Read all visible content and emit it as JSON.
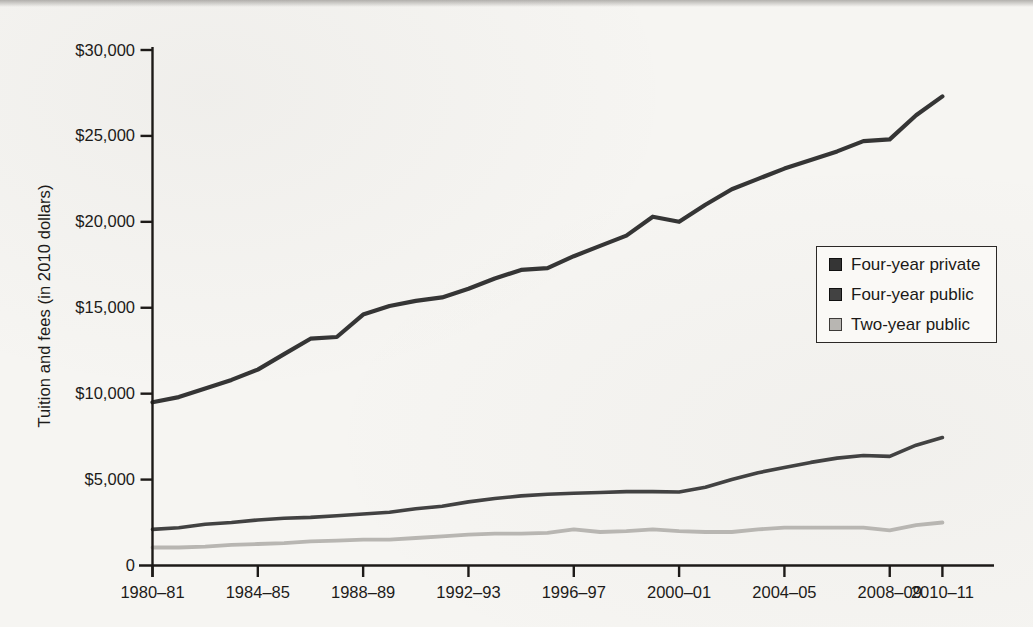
{
  "page": {
    "background_color": "#f6f5f2",
    "note": ""
  },
  "chart_data": {
    "type": "line",
    "title": "",
    "xlabel": "",
    "ylabel": "Tuition and fees (in 2010 dollars)",
    "ylim": [
      0,
      30000
    ],
    "grid": false,
    "legend_position": "middle-right",
    "axis_color": "#1d1a18",
    "tick_label_color": "#1d1b19",
    "y_ticks": [
      {
        "value": 30000,
        "label": "$30,000"
      },
      {
        "value": 25000,
        "label": "$25,000"
      },
      {
        "value": 20000,
        "label": "$20,000"
      },
      {
        "value": 15000,
        "label": "$15,000"
      },
      {
        "value": 10000,
        "label": "$10,000"
      },
      {
        "value": 5000,
        "label": "$5,000"
      },
      {
        "value": 0,
        "label": "0"
      }
    ],
    "categories": [
      "1980–81",
      "1981–82",
      "1982–83",
      "1983–84",
      "1984–85",
      "1985–86",
      "1986–87",
      "1987–88",
      "1988–89",
      "1989–90",
      "1990–91",
      "1991–92",
      "1992–93",
      "1993–94",
      "1994–95",
      "1995–96",
      "1996–97",
      "1997–98",
      "1998–99",
      "1999–00",
      "2000–01",
      "2001–02",
      "2002–03",
      "2003–04",
      "2004–05",
      "2005–06",
      "2006–07",
      "2007–08",
      "2008–09",
      "2009–10",
      "2010–11"
    ],
    "x_tick_indices": [
      0,
      4,
      8,
      12,
      16,
      20,
      24,
      28,
      30
    ],
    "series": [
      {
        "name": "Four-year private",
        "color": "#353535",
        "swatch_border": "#0f0f0f",
        "stroke_width": 4.2,
        "values": [
          9500,
          9800,
          10300,
          10800,
          11400,
          12300,
          13200,
          13300,
          14600,
          15100,
          15400,
          15600,
          16100,
          16700,
          17200,
          17300,
          18000,
          18600,
          19200,
          20300,
          20000,
          21000,
          21900,
          22500,
          23100,
          23600,
          24100,
          24700,
          24800,
          26200,
          27300
        ]
      },
      {
        "name": "Four-year public",
        "color": "#424242",
        "swatch_border": "#0f0f0f",
        "stroke_width": 3.6,
        "values": [
          2100,
          2200,
          2400,
          2500,
          2650,
          2750,
          2800,
          2900,
          3000,
          3100,
          3300,
          3450,
          3700,
          3900,
          4050,
          4150,
          4200,
          4250,
          4300,
          4300,
          4280,
          4550,
          5000,
          5400,
          5700,
          6000,
          6250,
          6400,
          6350,
          7000,
          7450
        ]
      },
      {
        "name": "Two-year public",
        "color": "#b8b6b2",
        "swatch_border": "#3d3b39",
        "stroke_width": 3.8,
        "values": [
          1050,
          1050,
          1100,
          1200,
          1250,
          1300,
          1400,
          1450,
          1500,
          1500,
          1600,
          1700,
          1800,
          1850,
          1850,
          1900,
          2100,
          1950,
          2000,
          2100,
          2000,
          1950,
          1950,
          2100,
          2200,
          2200,
          2200,
          2200,
          2050,
          2350,
          2500
        ]
      }
    ]
  }
}
